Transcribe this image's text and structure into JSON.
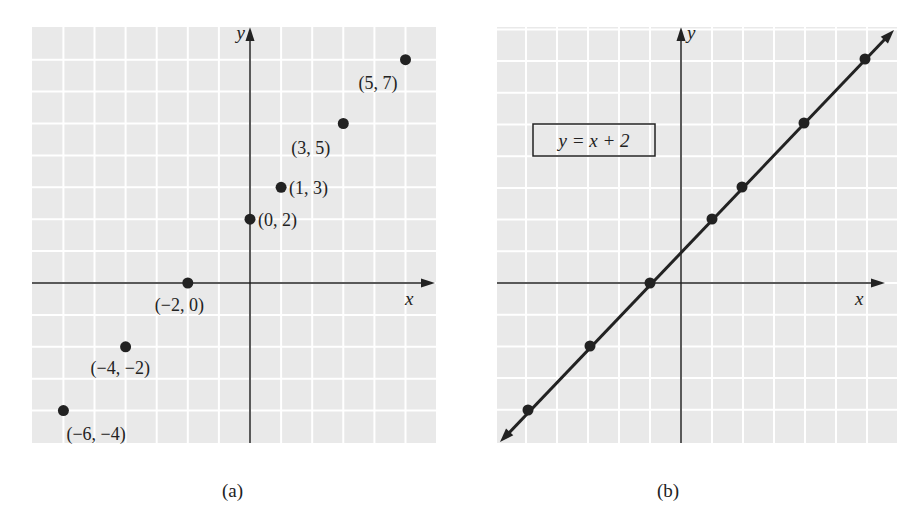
{
  "chart_data": [
    {
      "id": "a",
      "type": "scatter",
      "caption": "(a)",
      "xlabel": "x",
      "ylabel": "y",
      "grid": true,
      "xlim": [
        -7,
        6
      ],
      "ylim": [
        -5,
        8
      ],
      "points": [
        {
          "x": -6,
          "y": -4,
          "label": "(−6, −4)"
        },
        {
          "x": -4,
          "y": -2,
          "label": "(−4, −2)"
        },
        {
          "x": -2,
          "y": 0,
          "label": "(−2, 0)"
        },
        {
          "x": 0,
          "y": 2,
          "label": "(0, 2)"
        },
        {
          "x": 1,
          "y": 3,
          "label": "(1, 3)"
        },
        {
          "x": 3,
          "y": 5,
          "label": "(3, 5)"
        },
        {
          "x": 5,
          "y": 7,
          "label": "(5, 7)"
        }
      ]
    },
    {
      "id": "b",
      "type": "line",
      "caption": "(b)",
      "xlabel": "x",
      "ylabel": "y",
      "grid": true,
      "equation": "y = x + 2",
      "equation_label": "y = x + 2",
      "points": [
        {
          "x": -6,
          "y": -4
        },
        {
          "x": -4,
          "y": -2
        },
        {
          "x": -2,
          "y": 0
        },
        {
          "x": 0,
          "y": 2
        },
        {
          "x": 1,
          "y": 3
        },
        {
          "x": 3,
          "y": 5
        },
        {
          "x": 5,
          "y": 7
        }
      ],
      "arrows_both_ends": true
    }
  ],
  "colors": {
    "grid_background": "#e9e9e9",
    "grid_lines": "#ffffff",
    "ink": "#222222"
  }
}
